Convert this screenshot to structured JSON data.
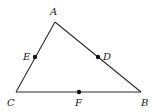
{
  "diagram": {
    "type": "triangle",
    "vertices": [
      {
        "id": "A",
        "label": "A",
        "x": 55,
        "y": 22,
        "lx": 50,
        "ly": 15
      },
      {
        "id": "B",
        "label": "B",
        "x": 141,
        "y": 92,
        "lx": 141,
        "ly": 106
      },
      {
        "id": "C",
        "label": "C",
        "x": 16,
        "y": 92,
        "lx": 7,
        "ly": 106
      }
    ],
    "edges": [
      {
        "from": "A",
        "to": "B"
      },
      {
        "from": "B",
        "to": "C"
      },
      {
        "from": "C",
        "to": "A"
      }
    ],
    "points": [
      {
        "id": "D",
        "label": "D",
        "on": "AB",
        "x": 98,
        "y": 57,
        "lx": 103,
        "ly": 60
      },
      {
        "id": "E",
        "label": "E",
        "on": "AC",
        "x": 35,
        "y": 57,
        "lx": 23,
        "ly": 60
      },
      {
        "id": "F",
        "label": "F",
        "on": "BC",
        "x": 79,
        "y": 92,
        "lx": 75,
        "ly": 106
      }
    ],
    "colors": {
      "line": "#2a2a2a",
      "point": "#111111",
      "background": "#ffffff"
    }
  }
}
